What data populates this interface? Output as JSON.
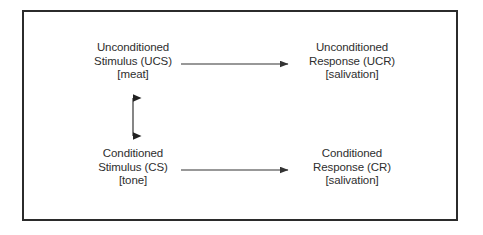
{
  "diagram": {
    "frame": {
      "border_color": "#2b2b2b",
      "background": "#ffffff"
    },
    "text_color": "#2e2e2e",
    "arrow_color": "#333333",
    "nodes": [
      {
        "id": "ucs",
        "name": "unconditioned-stimulus",
        "line1": "Unconditioned",
        "line2": "Stimulus (UCS)",
        "line3": "[meat]"
      },
      {
        "id": "ucr",
        "name": "unconditioned-response",
        "line1": "Unconditioned",
        "line2": "Response (UCR)",
        "line3": "[salivation]"
      },
      {
        "id": "cs",
        "name": "conditioned-stimulus",
        "line1": "Conditioned",
        "line2": "Stimulus (CS)",
        "line3": "[tone]"
      },
      {
        "id": "cr",
        "name": "conditioned-response",
        "line1": "Conditioned",
        "line2": "Response (CR)",
        "line3": "[salivation]"
      }
    ],
    "connectors": [
      {
        "id": "ucs-to-ucr",
        "name": "arrow-ucs-to-ucr",
        "type": "single-headed-arrow",
        "direction": "right",
        "from": "ucs",
        "to": "ucr"
      },
      {
        "id": "cs-to-cr",
        "name": "arrow-cs-to-cr",
        "type": "single-headed-arrow",
        "direction": "right",
        "from": "cs",
        "to": "cr"
      },
      {
        "id": "ucs-cs-pairing",
        "name": "arrow-ucs-cs-pairing",
        "type": "double-headed-arrow",
        "direction": "vertical",
        "from": "cs",
        "to": "ucs"
      }
    ]
  }
}
